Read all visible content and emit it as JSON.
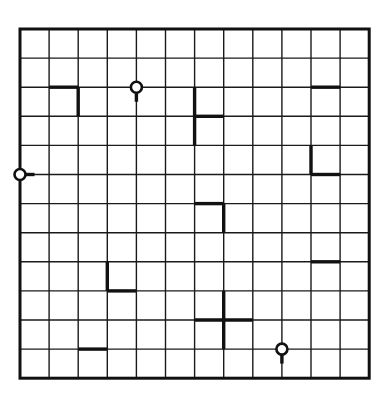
{
  "app": {
    "title": "Grid Puzzle",
    "description": "Hand-drawn 12 by 12 square lattice puzzle with thick overlay wall segments and small open circles attached to stems"
  },
  "colors": {
    "background": "#ffffff",
    "grid_line": "#1a1a1a",
    "border": "#111111",
    "mark": "#111111",
    "circle_fill": "#ffffff"
  },
  "board": {
    "name": "puzzle-grid",
    "columns": 12,
    "rows": 12,
    "origin_x": 20,
    "origin_y": 29,
    "cell_size": 29.1,
    "border_width": 3.0,
    "grid_line_width": 1.4,
    "mark_width": 3.4
  },
  "marks": {
    "label": "thick overlay segments",
    "segments": [
      {
        "name": "mark-corner-r1c1",
        "kind": "corner",
        "x1": 1,
        "y1": 2,
        "x2": 2,
        "y2": 2
      },
      {
        "name": "mark-corner-r1c1-leg",
        "kind": "vertical",
        "x1": 2,
        "y1": 2,
        "x2": 2,
        "y2": 3
      },
      {
        "name": "mark-topright-horizontal",
        "kind": "horizontal",
        "x1": 10,
        "y1": 2,
        "x2": 11,
        "y2": 2
      },
      {
        "name": "mark-h-vertical",
        "kind": "vertical",
        "x1": 6,
        "y1": 2,
        "x2": 6,
        "y2": 4
      },
      {
        "name": "mark-h-stub",
        "kind": "horizontal",
        "x1": 6,
        "y1": 3,
        "x2": 7,
        "y2": 3
      },
      {
        "name": "mark-right-l-vertical",
        "kind": "vertical",
        "x1": 10,
        "y1": 4,
        "x2": 10,
        "y2": 5
      },
      {
        "name": "mark-right-l-horizontal",
        "kind": "horizontal",
        "x1": 10,
        "y1": 5,
        "x2": 11,
        "y2": 5
      },
      {
        "name": "mark-center-t-horizontal",
        "kind": "horizontal",
        "x1": 6,
        "y1": 6,
        "x2": 7,
        "y2": 6
      },
      {
        "name": "mark-center-t-vertical",
        "kind": "vertical",
        "x1": 7,
        "y1": 6,
        "x2": 7,
        "y2": 7
      },
      {
        "name": "mark-right-mid-horizontal",
        "kind": "horizontal",
        "x1": 10,
        "y1": 8,
        "x2": 11,
        "y2": 8
      },
      {
        "name": "mark-lower-l-vertical",
        "kind": "vertical",
        "x1": 3,
        "y1": 8,
        "x2": 3,
        "y2": 9
      },
      {
        "name": "mark-lower-l-horizontal",
        "kind": "horizontal",
        "x1": 3,
        "y1": 9,
        "x2": 4,
        "y2": 9
      },
      {
        "name": "mark-cross-horizontal",
        "kind": "horizontal",
        "x1": 6,
        "y1": 10,
        "x2": 8,
        "y2": 10
      },
      {
        "name": "mark-cross-vertical",
        "kind": "vertical",
        "x1": 7,
        "y1": 9,
        "x2": 7,
        "y2": 11
      },
      {
        "name": "mark-bottom-horizontal",
        "kind": "horizontal",
        "x1": 2,
        "y1": 11,
        "x2": 3,
        "y2": 11
      }
    ],
    "circles": [
      {
        "name": "circle-node-top",
        "cx": 4,
        "cy": 2,
        "radius": 5.5,
        "stem": "down",
        "stem_length": 9
      },
      {
        "name": "circle-node-left",
        "cx": 0,
        "cy": 5,
        "radius": 5.5,
        "stem": "right",
        "stem_length": 9
      },
      {
        "name": "circle-node-bottom-right",
        "cx": 9,
        "cy": 11,
        "radius": 5.5,
        "stem": "down",
        "stem_length": 9
      }
    ]
  },
  "legend": {
    "circle_label": "open circle node",
    "segment_label": "thick wall segment"
  }
}
